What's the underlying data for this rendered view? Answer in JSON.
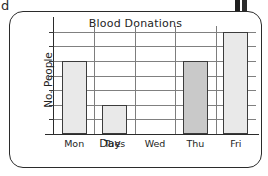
{
  "page": {
    "stray_letter": "d",
    "corner_figure_icon": "clipped-figure-icon",
    "frame_color": "#2b2b2b",
    "background": "#ffffff"
  },
  "chart_data": {
    "type": "bar",
    "title": "Blood Donations",
    "xlabel": "Day",
    "ylabel": "No. People",
    "categories": [
      "Mon",
      "Tues",
      "Wed",
      "Thu",
      "Fri"
    ],
    "values": [
      25,
      10,
      0,
      25,
      35
    ],
    "ylim": [
      0,
      37
    ],
    "ytick_labels": [
      "10",
      "20",
      "30"
    ],
    "ytick_values": [
      10,
      20,
      30
    ],
    "gridline_values": [
      5,
      10,
      15,
      20,
      25,
      30,
      35
    ],
    "grid": true,
    "legend": "none",
    "bar_colors": [
      "#e9e9e9",
      "#e9e9e9",
      "none",
      "#c9c9c9",
      "#e9e9e9"
    ],
    "bar_edge_color": "#3c3c3c",
    "gridline_color": "#808080",
    "axis_color": "#2b2b2b"
  }
}
